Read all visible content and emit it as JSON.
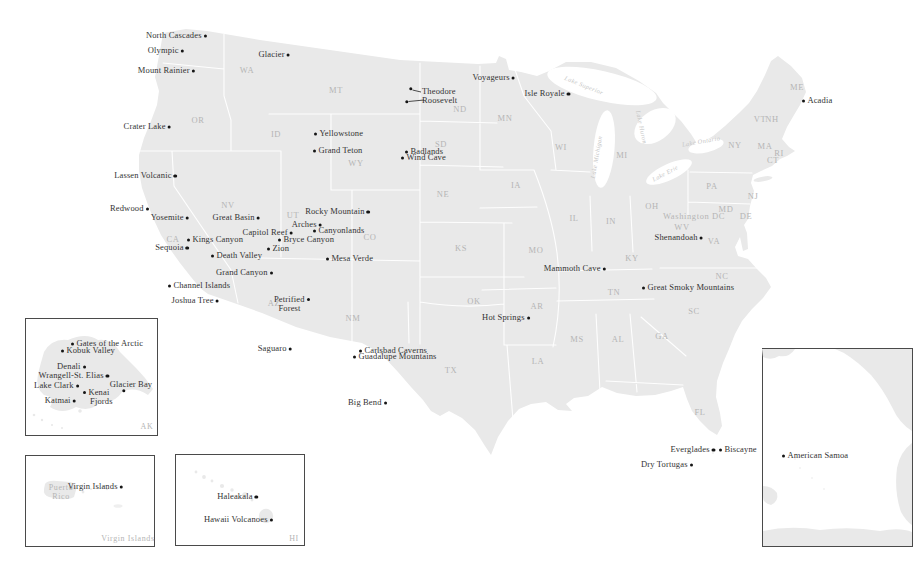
{
  "map": {
    "colors": {
      "land": "#e9e9e9",
      "state_border": "#ffffff",
      "park_text": "#333333",
      "state_text": "#b5b5b5",
      "lake_text": "#c6c6c6",
      "dot": "#151515",
      "inset_border": "#4a4a4a"
    },
    "parks": [
      {
        "name": "North Cascades",
        "x": 205,
        "y": 36,
        "side": "left"
      },
      {
        "name": "Olympic",
        "x": 182,
        "y": 51,
        "side": "left"
      },
      {
        "name": "Mount Rainier",
        "x": 193,
        "y": 71,
        "side": "left"
      },
      {
        "name": "Glacier",
        "x": 288,
        "y": 55,
        "side": "left"
      },
      {
        "name": "Crater Lake",
        "x": 169,
        "y": 127,
        "side": "left"
      },
      {
        "name": "Lassen Volcanic",
        "x": 175,
        "y": 176,
        "side": "left"
      },
      {
        "name": "Redwood",
        "x": 147,
        "y": 209,
        "side": "left"
      },
      {
        "name": "Yosemite",
        "x": 187,
        "y": 218,
        "side": "left"
      },
      {
        "name": "Great Basin",
        "x": 258,
        "y": 218,
        "side": "left"
      },
      {
        "name": "Rocky Mountain",
        "x": 368,
        "y": 212,
        "side": "left"
      },
      {
        "name": "Arches",
        "x": 320,
        "y": 225,
        "side": "left"
      },
      {
        "name": "Canyonlands",
        "x": 315,
        "y": 231,
        "side": "right"
      },
      {
        "name": "Capitol Reef",
        "x": 291,
        "y": 233,
        "side": "left"
      },
      {
        "name": "Bryce Canyon",
        "x": 280,
        "y": 240,
        "side": "right"
      },
      {
        "name": "Zion",
        "x": 269,
        "y": 249,
        "side": "right"
      },
      {
        "name": "Kings Canyon",
        "x": 189,
        "y": 240,
        "side": "right"
      },
      {
        "name": "Sequoia",
        "x": 187,
        "y": 248,
        "side": "left"
      },
      {
        "name": "Death Valley",
        "x": 213,
        "y": 256,
        "side": "right"
      },
      {
        "name": "Mesa Verde",
        "x": 328,
        "y": 259,
        "side": "right"
      },
      {
        "name": "Grand Canyon",
        "x": 271,
        "y": 273,
        "side": "left"
      },
      {
        "name": "Channel Islands",
        "x": 170,
        "y": 286,
        "side": "right"
      },
      {
        "name": "Petrified Forest",
        "lines": [
          "Petrified",
          "Forest"
        ],
        "x": 308,
        "y": 299,
        "side": "left"
      },
      {
        "name": "Joshua Tree",
        "x": 217,
        "y": 301,
        "side": "left"
      },
      {
        "name": "Yellowstone",
        "x": 316,
        "y": 134,
        "side": "right"
      },
      {
        "name": "Grand Teton",
        "x": 315,
        "y": 151,
        "side": "right"
      },
      {
        "name": "Theodore Roosevelt",
        "lines": [
          "Theodore",
          "Roosevelt"
        ],
        "x": 411,
        "y": 89,
        "x2": 407,
        "y2": 102,
        "side": "leader"
      },
      {
        "name": "Badlands",
        "x": 407,
        "y": 152,
        "side": "right"
      },
      {
        "name": "Wind Cave",
        "x": 403,
        "y": 158,
        "side": "right"
      },
      {
        "name": "Voyageurs",
        "x": 513,
        "y": 78,
        "side": "left"
      },
      {
        "name": "Isle Royale",
        "x": 568,
        "y": 94,
        "side": "left"
      },
      {
        "name": "Saguaro",
        "x": 290,
        "y": 349,
        "side": "left"
      },
      {
        "name": "Carlsbad Caverns",
        "x": 361,
        "y": 351,
        "side": "right"
      },
      {
        "name": "Guadalupe Mountains",
        "x": 355,
        "y": 357,
        "side": "right"
      },
      {
        "name": "Big Bend",
        "x": 385,
        "y": 403,
        "side": "left"
      },
      {
        "name": "Hot Springs",
        "x": 528,
        "y": 318,
        "side": "left"
      },
      {
        "name": "Mammoth Cave",
        "x": 604,
        "y": 269,
        "side": "left"
      },
      {
        "name": "Great Smoky Mountains",
        "x": 644,
        "y": 288,
        "side": "right"
      },
      {
        "name": "Shenandoah",
        "x": 701,
        "y": 238,
        "side": "left"
      },
      {
        "name": "Acadia",
        "x": 804,
        "y": 101,
        "side": "right"
      },
      {
        "name": "Everglades",
        "x": 713,
        "y": 450,
        "side": "left"
      },
      {
        "name": "Biscayne",
        "x": 721,
        "y": 450,
        "side": "right"
      },
      {
        "name": "Dry Tortugas",
        "x": 691,
        "y": 465,
        "side": "left"
      },
      {
        "name": "Gates of the Arctic",
        "x": 73,
        "y": 344,
        "side": "right"
      },
      {
        "name": "Kobuk Valley",
        "x": 63,
        "y": 351,
        "side": "right"
      },
      {
        "name": "Denali",
        "x": 84,
        "y": 367,
        "side": "left"
      },
      {
        "name": "Wrangell-St. Elias",
        "x": 107,
        "y": 376,
        "side": "left"
      },
      {
        "name": "Lake Clark",
        "x": 77,
        "y": 386,
        "side": "left"
      },
      {
        "name": "Kenai Fjords",
        "lines": [
          "Kenai",
          "Fjords"
        ],
        "x": 85,
        "y": 392,
        "side": "right"
      },
      {
        "name": "Katmai",
        "x": 74,
        "y": 401,
        "side": "left"
      },
      {
        "name": "Glacier Bay",
        "x": 124,
        "y": 391,
        "side": "above"
      },
      {
        "name": "Virgin Islands",
        "x": 121,
        "y": 487,
        "side": "left"
      },
      {
        "name": "Haleakala",
        "x": 256,
        "y": 497,
        "side": "left"
      },
      {
        "name": "Hawaii Volcanoes",
        "x": 271,
        "y": 520,
        "side": "left"
      },
      {
        "name": "American Samoa",
        "x": 784,
        "y": 456,
        "side": "right"
      }
    ],
    "states": [
      {
        "t": "WA",
        "x": 247,
        "y": 71
      },
      {
        "t": "OR",
        "x": 198,
        "y": 121
      },
      {
        "t": "ID",
        "x": 276,
        "y": 135
      },
      {
        "t": "MT",
        "x": 336,
        "y": 91
      },
      {
        "t": "WY",
        "x": 356,
        "y": 164
      },
      {
        "t": "CA",
        "x": 173,
        "y": 240
      },
      {
        "t": "NV",
        "x": 228,
        "y": 206
      },
      {
        "t": "UT",
        "x": 293,
        "y": 216
      },
      {
        "t": "CO",
        "x": 370,
        "y": 238
      },
      {
        "t": "AZ",
        "x": 274,
        "y": 304
      },
      {
        "t": "NM",
        "x": 353,
        "y": 319
      },
      {
        "t": "ND",
        "x": 460,
        "y": 110
      },
      {
        "t": "SD",
        "x": 441,
        "y": 145
      },
      {
        "t": "NE",
        "x": 443,
        "y": 195
      },
      {
        "t": "KS",
        "x": 461,
        "y": 249
      },
      {
        "t": "OK",
        "x": 474,
        "y": 302
      },
      {
        "t": "TX",
        "x": 451,
        "y": 371
      },
      {
        "t": "MN",
        "x": 505,
        "y": 119
      },
      {
        "t": "IA",
        "x": 516,
        "y": 186
      },
      {
        "t": "MO",
        "x": 536,
        "y": 251
      },
      {
        "t": "AR",
        "x": 537,
        "y": 307
      },
      {
        "t": "LA",
        "x": 538,
        "y": 362
      },
      {
        "t": "WI",
        "x": 561,
        "y": 148
      },
      {
        "t": "IL",
        "x": 574,
        "y": 219
      },
      {
        "t": "IN",
        "x": 611,
        "y": 222
      },
      {
        "t": "MI",
        "x": 622,
        "y": 156
      },
      {
        "t": "OH",
        "x": 652,
        "y": 207
      },
      {
        "t": "KY",
        "x": 632,
        "y": 259
      },
      {
        "t": "TN",
        "x": 614,
        "y": 293
      },
      {
        "t": "MS",
        "x": 577,
        "y": 340
      },
      {
        "t": "AL",
        "x": 618,
        "y": 340
      },
      {
        "t": "GA",
        "x": 662,
        "y": 337
      },
      {
        "t": "SC",
        "x": 694,
        "y": 312
      },
      {
        "t": "NC",
        "x": 722,
        "y": 277
      },
      {
        "t": "VA",
        "x": 714,
        "y": 242
      },
      {
        "t": "WV",
        "x": 682,
        "y": 228
      },
      {
        "t": "MD",
        "x": 726,
        "y": 210
      },
      {
        "t": "DE",
        "x": 746,
        "y": 217
      },
      {
        "t": "NJ",
        "x": 753,
        "y": 197
      },
      {
        "t": "PA",
        "x": 712,
        "y": 187
      },
      {
        "t": "NY",
        "x": 735,
        "y": 146
      },
      {
        "t": "VT",
        "x": 760,
        "y": 120
      },
      {
        "t": "NH",
        "x": 772,
        "y": 120
      },
      {
        "t": "MA",
        "x": 765,
        "y": 147
      },
      {
        "t": "RI",
        "x": 779,
        "y": 154
      },
      {
        "t": "CT",
        "x": 773,
        "y": 161
      },
      {
        "t": "ME",
        "x": 797,
        "y": 88
      },
      {
        "t": "FL",
        "x": 700,
        "y": 413
      },
      {
        "t": "Washington DC",
        "x": 694,
        "y": 217
      }
    ],
    "region_labels": [
      {
        "lines": [
          "Puerto",
          "Rico"
        ],
        "x": 61,
        "y": 492
      }
    ],
    "lakes": [
      {
        "name": "Lake Superior",
        "x": 584,
        "y": 85,
        "rot": 22
      },
      {
        "name": "Lake Michigan",
        "x": 596,
        "y": 157,
        "rot": -80
      },
      {
        "name": "Lake Huron",
        "x": 642,
        "y": 127,
        "rot": 78
      },
      {
        "name": "Lake Ontario",
        "x": 701,
        "y": 141,
        "rot": -10
      },
      {
        "name": "Lake Erie",
        "x": 665,
        "y": 173,
        "rot": -28
      }
    ],
    "insets": [
      {
        "name": "alaska",
        "label": "AK",
        "x": 25,
        "y": 318,
        "w": 133,
        "h": 118,
        "label_x": 147,
        "label_y": 427
      },
      {
        "name": "puerto-rico",
        "label": "Virgin Islands",
        "x": 25,
        "y": 455,
        "w": 130,
        "h": 92,
        "label_x": 128,
        "label_y": 539
      },
      {
        "name": "hawaii",
        "label": "HI",
        "x": 175,
        "y": 454,
        "w": 130,
        "h": 92,
        "label_x": 294,
        "label_y": 539
      },
      {
        "name": "american-samoa",
        "label": "",
        "x": 762,
        "y": 348,
        "w": 151,
        "h": 199,
        "label_x": 0,
        "label_y": 0
      }
    ]
  }
}
